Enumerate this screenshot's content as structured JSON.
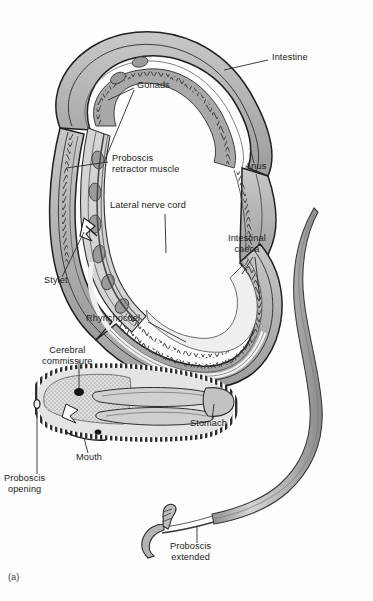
{
  "figure": {
    "caption": "(a)",
    "organism": "nemertean ribbon worm internal anatomy",
    "background_color": "#fdfdfd",
    "ink_color": "#1b1b1b"
  },
  "palette": {
    "outline": "#231f20",
    "body_wall_fill": "#b9b9b9",
    "body_cavity_fill": "#d8d8d8",
    "gut_fill": "#a9a9a9",
    "pale_fill": "#efefef",
    "proboscis_fill": "#c4c4c4",
    "leader_line": "#2a2a2a",
    "label_text": "#1b1b1b"
  },
  "labels": [
    {
      "id": "intestine",
      "text": "Intestine",
      "x": 272,
      "y": 57,
      "align": "left"
    },
    {
      "id": "gonads",
      "text": "Gonads",
      "x": 137,
      "y": 85,
      "align": "left"
    },
    {
      "id": "proboscis-retractor",
      "text": "Proboscis\nretractor muscle",
      "x": 112,
      "y": 158,
      "align": "left"
    },
    {
      "id": "anus",
      "text": "Anus",
      "x": 248,
      "y": 166,
      "align": "left"
    },
    {
      "id": "lateral-nerve-cord",
      "text": "Lateral nerve cord",
      "x": 110,
      "y": 205,
      "align": "left"
    },
    {
      "id": "intestinal-caeca",
      "text": "Intestinal\ncaeca",
      "x": 233,
      "y": 238,
      "align": "left"
    },
    {
      "id": "stylet",
      "text": "Stylet",
      "x": 47,
      "y": 280,
      "align": "left"
    },
    {
      "id": "rhynchocoel",
      "text": "Rhynchocoel",
      "x": 88,
      "y": 318,
      "align": "left"
    },
    {
      "id": "cerebral-commissure",
      "text": "Cerebral\ncommissure",
      "x": 46,
      "y": 350,
      "align": "left"
    },
    {
      "id": "stomach",
      "text": "Stomach",
      "x": 193,
      "y": 422,
      "align": "left"
    },
    {
      "id": "mouth",
      "text": "Mouth",
      "x": 77,
      "y": 457,
      "align": "left"
    },
    {
      "id": "proboscis-opening",
      "text": "Proboscis\nopening",
      "x": 8,
      "y": 478,
      "align": "left"
    },
    {
      "id": "proboscis-extended",
      "text": "Proboscis\nextended",
      "x": 174,
      "y": 546,
      "align": "left"
    }
  ],
  "structures": [
    {
      "id": "body-wall",
      "name": "body wall with sawtooth musculature"
    },
    {
      "id": "intestine",
      "name": "intestine running the length of the body"
    },
    {
      "id": "intestinal-caeca",
      "name": "lateral intestinal caeca"
    },
    {
      "id": "gonads",
      "name": "paired gonads along the body"
    },
    {
      "id": "proboscis-retractor",
      "name": "proboscis retractor muscle"
    },
    {
      "id": "rhynchocoel",
      "name": "fluid filled rhynchocoel cavity"
    },
    {
      "id": "lateral-nerve-cord",
      "name": "lateral nerve cord"
    },
    {
      "id": "cerebral-commissure",
      "name": "cerebral commissure ganglion"
    },
    {
      "id": "stylet",
      "name": "stylet on proboscis"
    },
    {
      "id": "stomach",
      "name": "stomach"
    },
    {
      "id": "mouth",
      "name": "mouth"
    },
    {
      "id": "proboscis-opening",
      "name": "proboscis opening at anterior tip"
    },
    {
      "id": "anus",
      "name": "anus at posterior tip"
    },
    {
      "id": "proboscis-extended",
      "name": "everted proboscis with stylet, shown separately"
    }
  ]
}
